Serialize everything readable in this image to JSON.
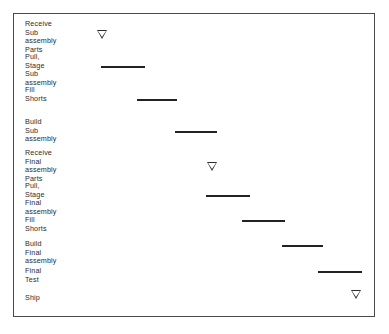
{
  "chart_data": {
    "type": "bar",
    "title": "",
    "subtitle": "",
    "xlabel": "",
    "ylabel": "",
    "orientation": "horizontal",
    "style": "gantt",
    "grid": false,
    "legend": false,
    "xlim": [
      0,
      100
    ],
    "axis_units": "time (unlabeled)",
    "categories": [
      "Receive\nSub assembly\nParts",
      "Pull, Stage\nSub assembly",
      "Fill\nShorts",
      "Build\nSub assembly",
      "Receive\nFinal assembly\nParts",
      "Pull, Stage\nFinal assembly",
      "Fill Shorts",
      "Build Final\nassembly",
      "Final Test",
      "Ship"
    ],
    "tasks": [
      {
        "label": "Receive\nSub assembly\nParts",
        "kind": "milestone",
        "start": 24.0,
        "end": 24.0,
        "duration": 0,
        "label_top": 6,
        "marker_top": 16,
        "marker_left": 83
      },
      {
        "label": "Pull, Stage\nSub assembly",
        "kind": "bar",
        "start": 24.0,
        "end": 36.2,
        "duration": 12.2,
        "label_top": 39,
        "bar_top": 52,
        "bar_left": 87,
        "bar_width": 44
      },
      {
        "label": "Fill\nShorts",
        "kind": "bar",
        "start": 34.0,
        "end": 45.0,
        "duration": 11.0,
        "label_top": 72,
        "bar_top": 85,
        "bar_left": 123,
        "bar_width": 40
      },
      {
        "label": "Build\nSub assembly",
        "kind": "bar",
        "start": 44.5,
        "end": 56.0,
        "duration": 11.5,
        "label_top": 104,
        "bar_top": 117,
        "bar_left": 161,
        "bar_width": 42
      },
      {
        "label": "Receive\nFinal assembly\nParts",
        "kind": "milestone",
        "start": 57.0,
        "end": 57.0,
        "duration": 0,
        "label_top": 135,
        "marker_top": 148,
        "marker_left": 193
      },
      {
        "label": "Pull, Stage\nFinal assembly",
        "kind": "bar",
        "start": 53.5,
        "end": 65.5,
        "duration": 12.0,
        "label_top": 168,
        "bar_top": 181,
        "bar_left": 192,
        "bar_width": 44
      },
      {
        "label": "Fill Shorts",
        "kind": "bar",
        "start": 63.5,
        "end": 75.0,
        "duration": 11.5,
        "label_top": 202,
        "bar_top": 206,
        "bar_left": 228,
        "bar_width": 43
      },
      {
        "label": "Build Final\nassembly",
        "kind": "bar",
        "start": 74.5,
        "end": 85.5,
        "duration": 11.0,
        "label_top": 226,
        "bar_top": 231,
        "bar_left": 268,
        "bar_width": 41
      },
      {
        "label": "Final Test",
        "kind": "bar",
        "start": 84.5,
        "end": 96.5,
        "duration": 12.0,
        "label_top": 253,
        "bar_top": 257,
        "bar_left": 304,
        "bar_width": 44
      },
      {
        "label": "Ship",
        "kind": "milestone",
        "start": 96.5,
        "end": 96.5,
        "duration": 0,
        "label_top": 280,
        "marker_top": 276,
        "marker_left": 337
      }
    ]
  }
}
